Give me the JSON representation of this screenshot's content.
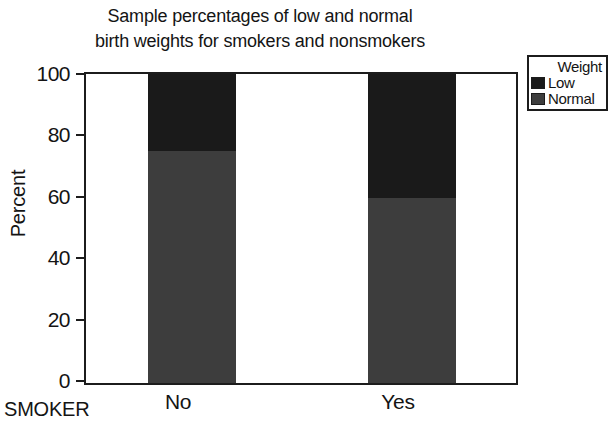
{
  "chart_data": {
    "type": "bar",
    "bar_mode": "stacked",
    "title": "Sample percentages of low and normal birth weights for smokers and nonsmokers",
    "title_lines": [
      "Sample percentages of low and normal",
      "birth weights for smokers and nonsmokers"
    ],
    "xlabel": "SMOKER",
    "ylabel": "Percent",
    "categories": [
      "No",
      "Yes"
    ],
    "ylim": [
      0,
      100
    ],
    "yticks": [
      0,
      20,
      40,
      60,
      80,
      100
    ],
    "ytick_labels": [
      "0",
      "20",
      "40",
      "60",
      "80",
      "100"
    ],
    "grid": false,
    "legend_position": "right-outside",
    "legend_title": "Weight",
    "series": [
      {
        "name": "Low",
        "values": [
          25,
          40
        ],
        "color": "#1a1a1a"
      },
      {
        "name": "Normal",
        "values": [
          75,
          60
        ],
        "color": "#3d3d3d"
      }
    ],
    "stack_order_bottom_to_top": [
      "Normal",
      "Low"
    ]
  },
  "legend": {
    "title": "Weight",
    "entries": [
      {
        "label": "Low",
        "color": "#1a1a1a"
      },
      {
        "label": "Normal",
        "color": "#3d3d3d"
      }
    ]
  },
  "axes": {
    "y_title": "Percent",
    "x_title": "SMOKER",
    "y_ticks": [
      {
        "value": 100,
        "label": "100"
      },
      {
        "value": 80,
        "label": "80"
      },
      {
        "value": 60,
        "label": "60"
      },
      {
        "value": 40,
        "label": "40"
      },
      {
        "value": 20,
        "label": "20"
      },
      {
        "value": 0,
        "label": "0"
      }
    ],
    "x_categories": [
      {
        "label": "No"
      },
      {
        "label": "Yes"
      }
    ]
  },
  "colors": {
    "axis": "#1c1c1c",
    "text": "#141414",
    "background": "#ffffff",
    "low": "#1a1a1a",
    "normal": "#3d3d3d"
  }
}
